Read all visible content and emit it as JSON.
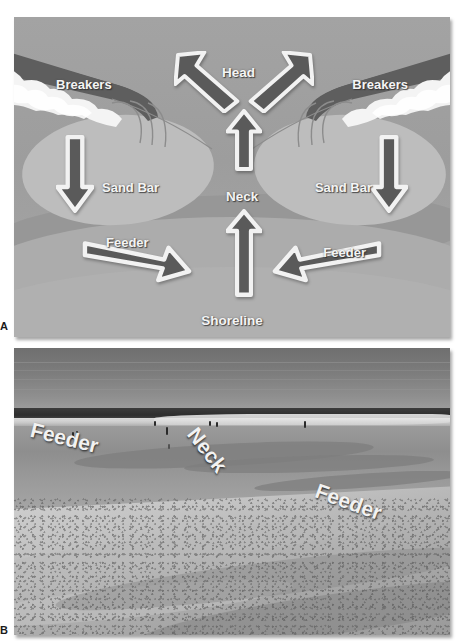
{
  "figure": {
    "panels": [
      {
        "letter": "A",
        "type": "diagram"
      },
      {
        "letter": "B",
        "type": "photograph"
      }
    ]
  },
  "panel_a": {
    "letter": "A",
    "caption_labels": {
      "breakers_left": "Breakers",
      "breakers_right": "Breakers",
      "head": "Head",
      "neck": "Neck",
      "sand_bar_left": "Sand Bar",
      "sand_bar_right": "Sand Bar",
      "feeder_left": "Feeder",
      "feeder_right": "Feeder",
      "shoreline": "Shoreline"
    },
    "arrows": [
      {
        "name": "head-left",
        "direction": "up-left",
        "label": "Head"
      },
      {
        "name": "head-right",
        "direction": "up-right",
        "label": "Head"
      },
      {
        "name": "neck-upper",
        "direction": "up",
        "label": "Neck"
      },
      {
        "name": "neck-lower",
        "direction": "up",
        "label": "Neck"
      },
      {
        "name": "breaker-left-down",
        "direction": "down",
        "label": ""
      },
      {
        "name": "breaker-right-down",
        "direction": "down",
        "label": ""
      },
      {
        "name": "feeder-left",
        "direction": "right",
        "label": "Feeder"
      },
      {
        "name": "feeder-right",
        "direction": "left",
        "label": "Feeder"
      }
    ],
    "colors": {
      "background_water": "#9f9f9f",
      "sand_bar": "#bdbdbd",
      "beach": "#b0b0b0",
      "arrow_fill": "#5a5a5a",
      "arrow_outline": "#f2f2f2",
      "breaker_wave": "#5e5e5e",
      "foam": "#f4f4f4",
      "label_text": "#f4f4f4"
    }
  },
  "panel_b": {
    "letter": "B",
    "caption_labels": {
      "feeder_left": "Feeder",
      "neck": "Neck",
      "feeder_right": "Feeder"
    },
    "scene": {
      "sky": "overcast grey sky",
      "horizon": "dark ocean band with breaking white surf",
      "foreground": "wet and dry beach sand with rip channel"
    },
    "colors": {
      "sky": "#7d7d7d",
      "ocean": "#3c3c3c",
      "surf_foam": "#e8e8e8",
      "wet_sand": "#949494",
      "dry_sand": "#c2c2c2",
      "label_text": "#f2f2f2"
    }
  }
}
